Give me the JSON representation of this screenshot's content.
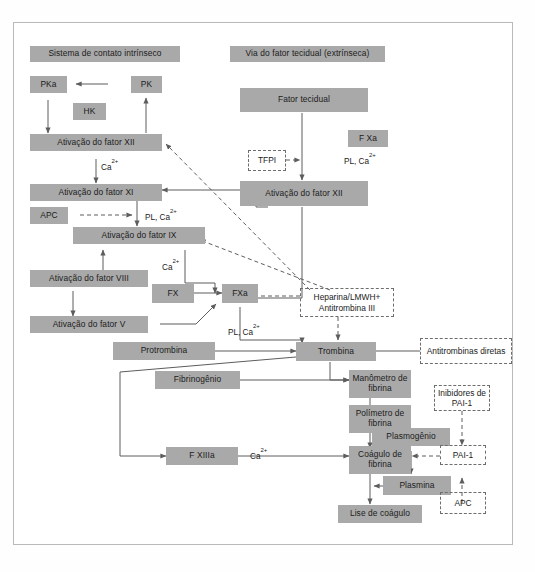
{
  "diagram": {
    "colors": {
      "node_fill": "#a9a9a9",
      "text": "#1b1b1b",
      "line": "#6d6d6d",
      "frame": "#b9b9b9"
    },
    "headers": [
      {
        "name": "intrinsic-header",
        "label": "Sistema de contato intrínseco"
      },
      {
        "name": "extrinsic-header",
        "label": "Via do fator tecidual (extrínseca)"
      }
    ],
    "nodes": [
      {
        "name": "node-pka",
        "label": "PKa"
      },
      {
        "name": "node-pk",
        "label": "PK"
      },
      {
        "name": "node-hk",
        "label": "HK"
      },
      {
        "name": "node-ativacao-fator-xii-intrinseco",
        "label": "Ativação do fator XII"
      },
      {
        "name": "node-ativacao-fator-xi",
        "label": "Ativação do fator XI"
      },
      {
        "name": "node-apc-upper",
        "label": "APC"
      },
      {
        "name": "node-ativacao-fator-ix",
        "label": "Ativação do fator IX"
      },
      {
        "name": "node-ativacao-fator-viii",
        "label": "Ativação do fator VIII"
      },
      {
        "name": "node-ativacao-fator-v",
        "label": "Ativação do fator V"
      },
      {
        "name": "node-fx",
        "label": "FX"
      },
      {
        "name": "node-fxa",
        "label": "FXa"
      },
      {
        "name": "node-protrombina",
        "label": "Protrombina"
      },
      {
        "name": "node-trombina",
        "label": "Trombina"
      },
      {
        "name": "node-fibrinogenio",
        "label": "Fibrinogênio"
      },
      {
        "name": "node-f-xiiia",
        "label": "F XIIIa"
      },
      {
        "name": "node-fator-tecidual",
        "label": "Fator tecidual"
      },
      {
        "name": "node-f-xa",
        "label": "F Xa"
      },
      {
        "name": "node-ativacao-fator-xii-extrinseco",
        "label": "Ativação do fator XII"
      },
      {
        "name": "node-manometro-fibrina",
        "label": "Manômetro de fibrina"
      },
      {
        "name": "node-polimetro-fibrina",
        "label": "Polímetro de fibrina"
      },
      {
        "name": "node-coagulo-fibrina",
        "label": "Coágulo de fibrina"
      },
      {
        "name": "node-lise-coagulo",
        "label": "Lise de coágulo"
      },
      {
        "name": "node-plasmogenio",
        "label": "Plasmogênio"
      },
      {
        "name": "node-plasmina",
        "label": "Plasmina"
      }
    ],
    "inhibitor_nodes": [
      {
        "name": "node-tfpi",
        "label": "TFPI"
      },
      {
        "name": "node-heparina",
        "label": "Heparina/LMWH+ Antitrombina III"
      },
      {
        "name": "node-antitrombinas-diretas",
        "label": "Antitrombinas diretas"
      },
      {
        "name": "node-inibidores-pai1",
        "label": "Inibidores de PAI-1"
      },
      {
        "name": "node-pai1",
        "label": "PAI-1"
      },
      {
        "name": "node-apc-lower",
        "label": "APC"
      }
    ],
    "cofactor_labels": [
      {
        "name": "label-ca-xii-xi",
        "label": "Ca2+"
      },
      {
        "name": "label-pl-ca-xi-ix",
        "label": "PL, Ca2+"
      },
      {
        "name": "label-ca-ix-fx",
        "label": "Ca2+"
      },
      {
        "name": "label-pl-ca-fxa-trombina",
        "label": "PL, Ca2+"
      },
      {
        "name": "label-pl-ca-fxa-extrinseco",
        "label": "PL, Ca2+"
      },
      {
        "name": "label-ca-fxiiia-coagulo",
        "label": "Ca2+"
      }
    ]
  }
}
